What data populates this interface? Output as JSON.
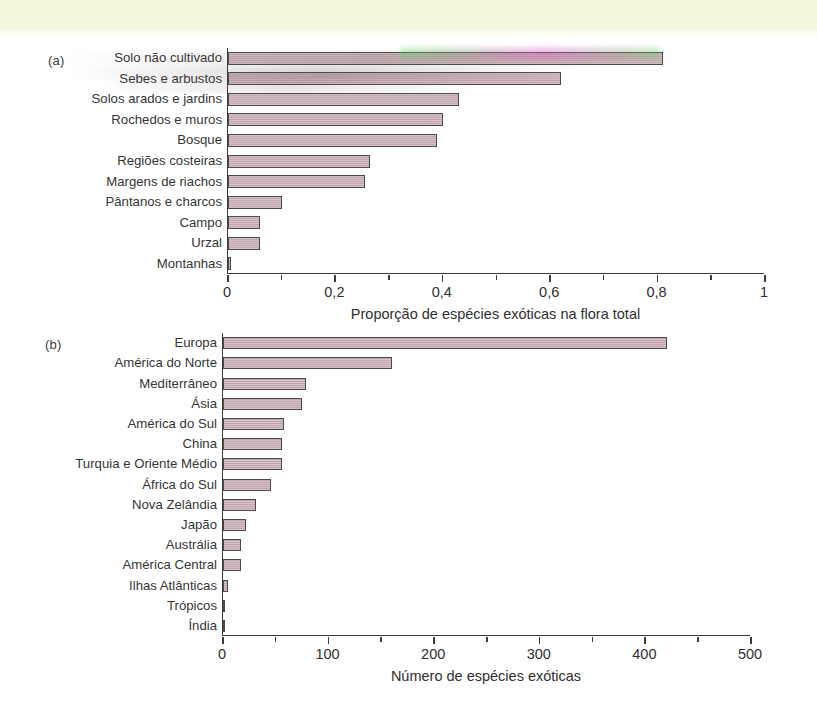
{
  "page": {
    "background_color": "#ffffff",
    "top_band_color": "#f4f7dc",
    "bar_fill_color": "#c4a6ae",
    "bar_stroke_color": "#4a4a4a",
    "axis_color": "#3b3b3b"
  },
  "chart_data": [
    {
      "type": "bar",
      "orientation": "horizontal",
      "panel": "(a)",
      "title": "",
      "xlabel": "Proporção de espécies exóticas na flora total",
      "ylabel": "",
      "xlim": [
        0,
        1
      ],
      "xticks": [
        0,
        0.2,
        0.4,
        0.6,
        0.8,
        1
      ],
      "xticklabels": [
        "0",
        "0,2",
        "0,4",
        "0,6",
        "0,8",
        "1"
      ],
      "minor_tick_step": 0.1,
      "grid": false,
      "legend": false,
      "categories": [
        "Solo não cultivado",
        "Sebes e arbustos",
        "Solos arados e jardins",
        "Rochedos e muros",
        "Bosque",
        "Regiões costeiras",
        "Margens de riachos",
        "Pântanos e charcos",
        "Campo",
        "Urzal",
        "Montanhas"
      ],
      "values": [
        0.81,
        0.62,
        0.43,
        0.4,
        0.39,
        0.265,
        0.255,
        0.1,
        0.06,
        0.06,
        0.005
      ]
    },
    {
      "type": "bar",
      "orientation": "horizontal",
      "panel": "(b)",
      "title": "",
      "xlabel": "Número de espécies exóticas",
      "ylabel": "",
      "xlim": [
        0,
        500
      ],
      "xticks": [
        0,
        100,
        200,
        300,
        400,
        500
      ],
      "xticklabels": [
        "0",
        "100",
        "200",
        "300",
        "400",
        "500"
      ],
      "minor_tick_step": 50,
      "grid": false,
      "legend": false,
      "categories": [
        "Europa",
        "América do Norte",
        "Mediterrâneo",
        "Ásia",
        "América do Sul",
        "China",
        "Turquia e Oriente Médio",
        "África do Sul",
        "Nova Zelândia",
        "Japão",
        "Austrália",
        "América Central",
        "Ilhas Atlânticas",
        "Trópicos",
        "Índia"
      ],
      "values": [
        420,
        160,
        79,
        75,
        58,
        56,
        56,
        45,
        31,
        22,
        17,
        17,
        5,
        2,
        2
      ]
    }
  ]
}
